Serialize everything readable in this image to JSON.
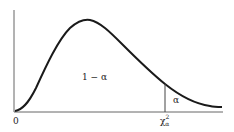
{
  "diagram": {
    "type": "chi-square distribution density with upper-tail critical region",
    "labels": {
      "origin": "0",
      "central_area": "1 − α",
      "tail_area": "α",
      "critical_value_base": "χ",
      "critical_value_sup": "2",
      "critical_value_sub": "α"
    },
    "colors": {
      "line": "#1a1a1a",
      "axis": "#555555",
      "background": "#ffffff"
    }
  }
}
